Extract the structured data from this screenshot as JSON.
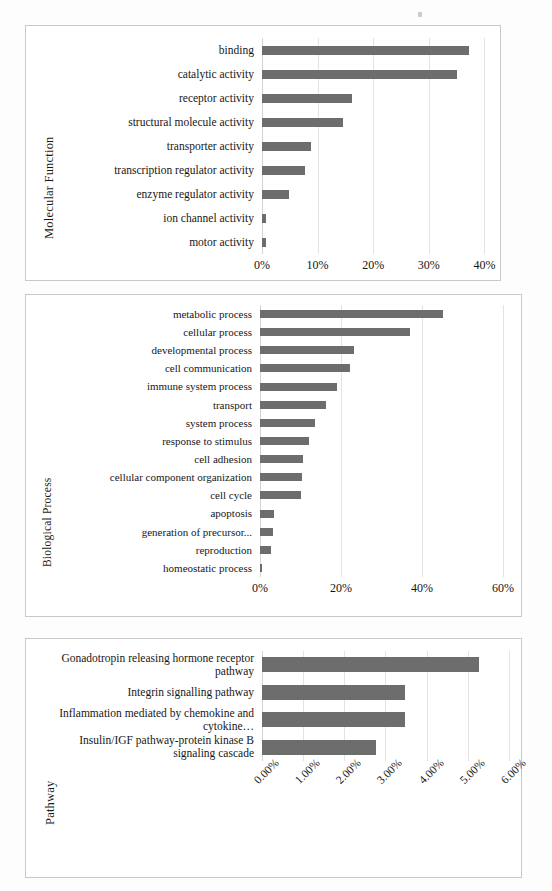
{
  "figure": {
    "bar_color": "#6d6d6d",
    "grid_color": "#e3e3e3",
    "panel_border_color": "#c9c9c9"
  },
  "chart_data": [
    {
      "id": "molecular-function",
      "type": "bar",
      "orientation": "horizontal",
      "title": "",
      "ylabel": "Molecular Function",
      "xlabel": "",
      "xlim": [
        0,
        41
      ],
      "xticks": [
        0,
        10,
        20,
        30,
        40
      ],
      "xtick_labels": [
        "0%",
        "10%",
        "20%",
        "30%",
        "40%"
      ],
      "grid": true,
      "legend": "none",
      "categories": [
        "motor activity",
        "ion channel activity",
        "enzyme regulator activity",
        "transcription regulator activity",
        "transporter activity",
        "structural molecule activity",
        "receptor activity",
        "catalytic activity",
        "binding"
      ],
      "values": [
        0.7,
        0.7,
        4.8,
        7.8,
        8.9,
        14.6,
        16.2,
        35.0,
        37.3
      ]
    },
    {
      "id": "biological-process",
      "type": "bar",
      "orientation": "horizontal",
      "title": "",
      "ylabel": "Biological Process",
      "xlabel": "",
      "xlim": [
        0,
        62
      ],
      "xticks": [
        0,
        20,
        40,
        60
      ],
      "xtick_labels": [
        "0%",
        "20%",
        "40%",
        "60%"
      ],
      "grid": true,
      "legend": "none",
      "categories": [
        "homeostatic process",
        "reproduction",
        "generation of precursor...",
        "apoptosis",
        "cell cycle",
        "cellular component organization",
        "cell adhesion",
        "response to stimulus",
        "system process",
        "transport",
        "immune system process",
        "cell communication",
        "developmental process",
        "cellular process",
        "metabolic process"
      ],
      "values": [
        0.6,
        2.8,
        3.3,
        3.4,
        10.2,
        10.4,
        10.6,
        12.2,
        13.5,
        16.4,
        19.0,
        22.2,
        23.3,
        37.0,
        45.3
      ]
    },
    {
      "id": "pathway",
      "type": "bar",
      "orientation": "horizontal",
      "title": "",
      "ylabel": "Pathway",
      "xlabel": "",
      "xlim": [
        0,
        6.05
      ],
      "xticks": [
        0,
        1,
        2,
        3,
        4,
        5,
        6
      ],
      "xtick_labels": [
        "0.00%",
        "1.00%",
        "2.00%",
        "3.00%",
        "4.00%",
        "5.00%",
        "6.00%"
      ],
      "grid": true,
      "legend": "none",
      "categories": [
        "Insulin/IGF pathway-protein kinase B signaling cascade",
        "Inflammation mediated by chemokine and cytokine…",
        "Integrin signalling pathway",
        "Gonadotropin releasing hormone receptor pathway"
      ],
      "values": [
        2.78,
        3.48,
        3.48,
        5.28
      ]
    }
  ]
}
